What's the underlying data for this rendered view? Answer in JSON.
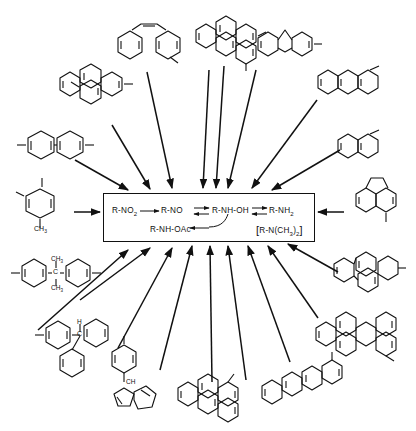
{
  "figure": {
    "type": "chemical-pathway-diagram"
  },
  "center_box": {
    "name": "metabolic-pathway-box",
    "nitro": "R-NO",
    "nitro_sub": "2",
    "nitroso": "R-NO",
    "hydroxylamine": "R-NH-OH",
    "amine": "R-NH",
    "amine_sub": "2",
    "acetoxy": "R-NH-OAc",
    "dimethylamine_open": "[",
    "dimethylamine": "R-N(CH",
    "dimethylamine_sub": "3",
    "dimethylamine_tail": ")",
    "dimethylamine_sub2": "2",
    "dimethylamine_close": "]"
  },
  "labels": {
    "toluidine_methyl": "CH",
    "toluidine_methyl_sub": "3",
    "bisphenyl_methyl_top": "CH",
    "bisphenyl_methyl_top_sub": "3",
    "bisphenyl_methyl_bottom": "CH",
    "bisphenyl_methyl_bottom_sub": "3",
    "bisphenyl_carbon": "C",
    "triphenyl_hydrogen": "H",
    "triphenyl_carbon": "C",
    "fluorenyl_ch": "CH"
  },
  "structures": [
    {
      "id": "toluidine",
      "name": "methyl-aniline",
      "position": "left"
    },
    {
      "id": "biphenyl",
      "name": "biphenyl-benzidine",
      "position": "upper-left"
    },
    {
      "id": "pyrene",
      "name": "pyrene",
      "position": "upper-left"
    },
    {
      "id": "stilbene",
      "name": "aminostilbene",
      "position": "top-left"
    },
    {
      "id": "chrysene",
      "name": "methyl-chrysene",
      "position": "top-center"
    },
    {
      "id": "fluorene",
      "name": "fluorene",
      "position": "top-right"
    },
    {
      "id": "anthracene",
      "name": "anthracene",
      "position": "upper-right"
    },
    {
      "id": "naphthalene",
      "name": "naphthylamine",
      "position": "right-upper"
    },
    {
      "id": "acenaphthene",
      "name": "acenaphthene",
      "position": "right"
    },
    {
      "id": "fluoranthene",
      "name": "fluoranthene",
      "position": "right-lower"
    },
    {
      "id": "perylene",
      "name": "perylene",
      "position": "bottom-right"
    },
    {
      "id": "benzanthracene",
      "name": "methyl-benz-a-anthracene",
      "position": "bottom-right-2"
    },
    {
      "id": "methylchrysene2",
      "name": "methyl-benzanthracene",
      "position": "bottom-center"
    },
    {
      "id": "fluorenyl",
      "name": "phenyl-fluorenyl-carbinol",
      "position": "bottom-left-2"
    },
    {
      "id": "triphenylmethane",
      "name": "triphenylmethane",
      "position": "bottom-left"
    },
    {
      "id": "bisphenyl",
      "name": "bis-aminophenyl-propane",
      "position": "left-lower"
    }
  ],
  "colors": {
    "ink": "#111111",
    "background": "#ffffff"
  }
}
